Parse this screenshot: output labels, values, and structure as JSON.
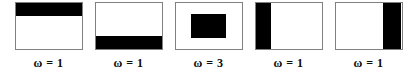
{
  "figure": {
    "background": "#ffffff",
    "box_border_color": "#808080",
    "fill_color": "#000000",
    "panel_count": 5
  },
  "panels": [
    {
      "id": "panel-1",
      "label": "ω = 1",
      "omega": 1,
      "region": {
        "name": "top-band",
        "left_pct": 0,
        "top_pct": 0,
        "width_pct": 100,
        "height_pct": 28
      }
    },
    {
      "id": "panel-2",
      "label": "ω = 1",
      "omega": 1,
      "region": {
        "name": "bottom-band",
        "left_pct": 0,
        "top_pct": 72,
        "width_pct": 100,
        "height_pct": 28
      }
    },
    {
      "id": "panel-3",
      "label": "ω = 3",
      "omega": 3,
      "region": {
        "name": "center-rectangle",
        "left_pct": 24,
        "top_pct": 24,
        "width_pct": 52,
        "height_pct": 52
      }
    },
    {
      "id": "panel-4",
      "label": "ω = 1",
      "omega": 1,
      "region": {
        "name": "left-band",
        "left_pct": 0,
        "top_pct": 0,
        "width_pct": 23,
        "height_pct": 100
      }
    },
    {
      "id": "panel-5",
      "label": "ω = 1",
      "omega": 1,
      "region": {
        "name": "right-band",
        "left_pct": 72,
        "top_pct": 0,
        "width_pct": 28,
        "height_pct": 100
      }
    }
  ]
}
